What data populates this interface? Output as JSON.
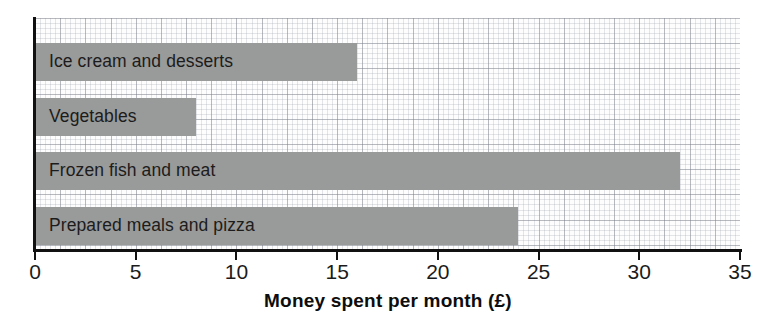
{
  "chart_data": {
    "type": "bar",
    "orientation": "horizontal",
    "title": "",
    "xlabel": "Money spent per month (£)",
    "ylabel": "",
    "categories": [
      "Ice cream and desserts",
      "Vegetables",
      "Frozen fish and meat",
      "Prepared meals and pizza"
    ],
    "values": [
      16,
      8,
      32,
      24
    ],
    "xlim": [
      0,
      35
    ],
    "xticks": [
      0,
      5,
      10,
      15,
      20,
      25,
      30,
      35
    ],
    "xtick_labels": [
      "0",
      "5",
      "10",
      "15",
      "20",
      "25",
      "30",
      "35"
    ],
    "grid": true,
    "grid_style": "graph-paper",
    "legend": false,
    "bar_color": "#999a9a",
    "axis_color": "#111111",
    "label_color": "#1c1c1c",
    "background": "#ffffff"
  },
  "bars": [
    {
      "label": "Ice cream and desserts",
      "value": 16,
      "top": 25
    },
    {
      "label": "Vegetables",
      "value": 8,
      "top": 80
    },
    {
      "label": "Frozen fish and meat",
      "value": 32,
      "top": 134
    },
    {
      "label": "Prepared meals and pizza",
      "value": 24,
      "top": 189
    }
  ],
  "axis": {
    "title": "Money spent per month (£)",
    "ticks": [
      "0",
      "5",
      "10",
      "15",
      "20",
      "25",
      "30",
      "35"
    ]
  }
}
